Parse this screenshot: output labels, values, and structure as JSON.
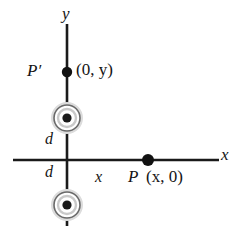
{
  "figure": {
    "axes": {
      "x_label": "x",
      "y_label": "y",
      "origin": [
        67,
        160
      ]
    },
    "labels": {
      "p_prime": "P′",
      "p_prime_coord": "(0, y)",
      "p": "P",
      "p_coord": "(x, 0)",
      "distance_upper": "d",
      "distance_lower": "d",
      "distance_x": "x"
    },
    "points": [
      {
        "name": "P-prime",
        "label": "P′",
        "coord_text": "(0, y)",
        "cx": 67,
        "cy": 72,
        "r": 5
      },
      {
        "name": "P",
        "label": "P",
        "coord_text": "(x, 0)",
        "cx": 148,
        "cy": 160,
        "r": 6
      }
    ],
    "wires": [
      {
        "name": "wire-upper",
        "symbol": "current-out-of-page",
        "cx": 67,
        "cy": 118,
        "outer_r": 14,
        "inner_r": 9,
        "dot_r": 4.5
      },
      {
        "name": "wire-lower",
        "symbol": "current-out-of-page",
        "cx": 67,
        "cy": 205,
        "outer_r": 14,
        "inner_r": 9,
        "dot_r": 4.5
      }
    ],
    "colors": {
      "line": "#1a1a1a",
      "text": "#141414",
      "ring_outer": "#555555",
      "ring_halo": "#d9d9d9",
      "background": "#ffffff"
    }
  }
}
